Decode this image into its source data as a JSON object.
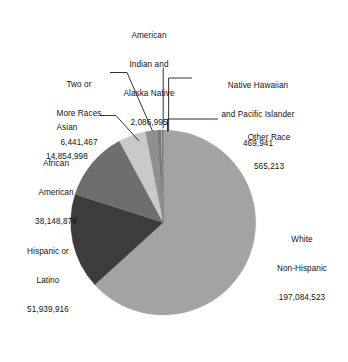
{
  "chart_data": {
    "type": "pie",
    "title": "",
    "subtitle": "",
    "xlabel": "",
    "ylabel": "",
    "legend_position": "none",
    "grid": false,
    "labels_outside": true,
    "leader_lines": true,
    "total": 311602029,
    "categories": [
      "White Non-Hispanic",
      "Hispanic or Latino",
      "African American",
      "Asian",
      "Two or More Races",
      "American Indian and Alaska Native",
      "Other Race",
      "Native Hawaiian and Pacific Islander"
    ],
    "values": [
      197084523,
      51939916,
      38148876,
      14854998,
      6441467,
      2086995,
      565213,
      469941
    ],
    "value_labels": [
      "197,084,523",
      "51,939,916",
      "38,148,876",
      "14,854,998",
      "6,441,467",
      "2,086,995",
      "565,213",
      "469,941"
    ],
    "percentages": [
      63.25,
      16.67,
      12.24,
      4.77,
      2.07,
      0.67,
      0.18,
      0.15
    ],
    "slice_colors": [
      "#a3a3a3",
      "#3c3c3c",
      "#6e6e6e",
      "#c9c9c9",
      "#8f8f8f",
      "#787878",
      "#b5b5b5",
      "#5a5a5a"
    ]
  },
  "slices": [
    {
      "key": "white",
      "name_lines": [
        "White",
        "Non-Hispanic"
      ],
      "value": "197,084,523",
      "color": "#a3a3a3"
    },
    {
      "key": "hispanic",
      "name_lines": [
        "Hispanic or",
        "Latino"
      ],
      "value": "51,939,916",
      "color": "#3c3c3c"
    },
    {
      "key": "african-american",
      "name_lines": [
        "African",
        "American"
      ],
      "value": "38,148,876",
      "color": "#6e6e6e"
    },
    {
      "key": "asian",
      "name_lines": [
        "Asian"
      ],
      "value": "14,854,998",
      "color": "#c9c9c9"
    },
    {
      "key": "two-or-more-races",
      "name_lines": [
        "Two or",
        "More Races"
      ],
      "value": "6,441,467",
      "color": "#8f8f8f"
    },
    {
      "key": "american-indian",
      "name_lines": [
        "American",
        "Indian and",
        "Alaska Native"
      ],
      "value": "2,086,995",
      "color": "#787878"
    },
    {
      "key": "other-race",
      "name_lines": [
        "Other Race"
      ],
      "value": "565,213",
      "color": "#b5b5b5"
    },
    {
      "key": "native-hawaiian",
      "name_lines": [
        "Native Hawaiian",
        "and Pacific Islander"
      ],
      "value": "469,941",
      "color": "#5a5a5a"
    }
  ],
  "labels": {
    "american_indian": {
      "l1": "American",
      "l2": "Indian and",
      "l3": "Alaska Native",
      "value": "2,086,995"
    },
    "native_hawaiian": {
      "l1": "Native Hawaiian",
      "l2": "and Pacific Islander",
      "value": "469,941"
    },
    "other_race": {
      "l1": "Other Race",
      "value": "565,213"
    },
    "two_or_more": {
      "l1": "Two or",
      "l2": "More Races",
      "value": "6,441,467"
    },
    "asian": {
      "l1": "Asian",
      "value": "14,854,998"
    },
    "african_american": {
      "l1": "African",
      "l2": "American",
      "value": "38,148,876"
    },
    "hispanic": {
      "l1": "Hispanic or",
      "l2": "Latino",
      "value": "51,939,916"
    },
    "white": {
      "l1": "White",
      "l2": "Non-Hispanic",
      "value": "197,084,523"
    }
  },
  "style": {
    "background": "#ffffff",
    "text_color": "#121212",
    "leader_line_color": "#1c1c1c"
  }
}
